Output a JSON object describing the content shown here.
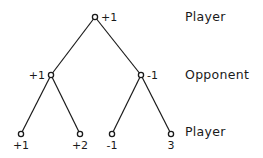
{
  "levels": [
    {
      "label": "Player",
      "y": 17
    },
    {
      "label": "Opponent",
      "y": 75
    },
    {
      "label": "Player",
      "y": 132
    }
  ],
  "nodes": [
    {
      "id": "root",
      "x": 95,
      "y": 17,
      "value": "+1",
      "label_pos": "right"
    },
    {
      "id": "left",
      "x": 51,
      "y": 75,
      "value": "+1",
      "label_pos": "left"
    },
    {
      "id": "right",
      "x": 141,
      "y": 75,
      "value": "-1",
      "label_pos": "right"
    },
    {
      "id": "leaf1",
      "x": 21,
      "y": 134,
      "value": "+1",
      "label_pos": "below"
    },
    {
      "id": "leaf2",
      "x": 80,
      "y": 134,
      "value": "+2",
      "label_pos": "below"
    },
    {
      "id": "leaf3",
      "x": 112,
      "y": 134,
      "value": "-1",
      "label_pos": "below"
    },
    {
      "id": "leaf4",
      "x": 171,
      "y": 134,
      "value": "3",
      "label_pos": "below"
    }
  ],
  "edges": [
    [
      "root",
      "left"
    ],
    [
      "root",
      "right"
    ],
    [
      "left",
      "leaf1"
    ],
    [
      "left",
      "leaf2"
    ],
    [
      "right",
      "leaf3"
    ],
    [
      "right",
      "leaf4"
    ]
  ],
  "colors": {
    "ink": "#1a1a1a",
    "background": "#ffffff"
  }
}
